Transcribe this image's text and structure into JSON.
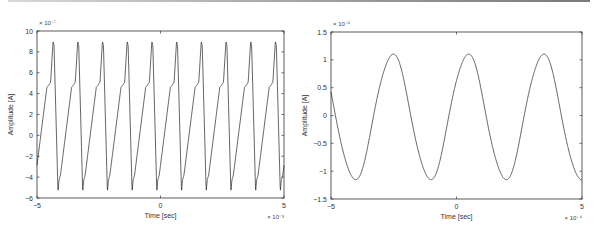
{
  "chart_data": [
    {
      "type": "line",
      "title": "",
      "xlabel": "Time [sec]",
      "ylabel": "Amplitude [A]",
      "x_multiplier": "× 10⁻³",
      "y_multiplier": "× 10⁻⁷",
      "xlim": [
        -5,
        5
      ],
      "ylim": [
        -6,
        10
      ],
      "xticks": [
        -5,
        0,
        5
      ],
      "yticks": [
        -6,
        -4,
        -2,
        0,
        2,
        4,
        6,
        8,
        10
      ],
      "grid": false,
      "legend": null,
      "series": [
        {
          "name": "current",
          "period": 1.0,
          "peak": 9.0,
          "shoulder": 4.8,
          "trough": -5.4,
          "knee": -4.0,
          "first_peak_x": -4.35,
          "num_peaks": 10,
          "description": "Periodic non-sinusoidal waveform, ~1 kHz; sharp peak ~9, shoulder ~4.8 on rising edge, trough ~-5.4 with knee ~-4"
        }
      ],
      "frame": {
        "left": 37,
        "top": 31,
        "right": 284,
        "bottom": 198
      }
    },
    {
      "type": "line",
      "title": "",
      "xlabel": "Time [sec]",
      "ylabel": "Amplitude [A]",
      "x_multiplier": "× 10⁻⁴",
      "y_multiplier": "× 10⁻⁵",
      "xlim": [
        -5,
        5
      ],
      "ylim": [
        -1.5,
        1.5
      ],
      "xticks": [
        -5,
        0,
        5
      ],
      "yticks": [
        -1.5,
        -1,
        -0.5,
        0,
        0.5,
        1,
        1.5
      ],
      "grid": false,
      "legend": null,
      "series": [
        {
          "name": "current",
          "period": 3.0,
          "peak": 1.1,
          "trough": -1.15,
          "peaks_x": [
            -2.55,
            0.45,
            3.45
          ],
          "troughs_x": [
            -4.1,
            -1.1,
            1.9
          ],
          "start_y": 0.5,
          "end_y": -1.15,
          "description": "Near-sinusoidal waveform, period ~3e-4 s, amplitude ~1.1e-5 A"
        }
      ],
      "frame": {
        "left": 331,
        "top": 32,
        "right": 582,
        "bottom": 199
      }
    }
  ]
}
